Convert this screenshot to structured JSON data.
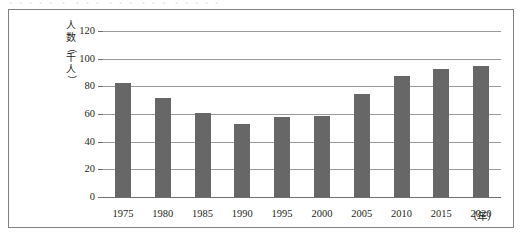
{
  "page": {
    "top_cut_text": "・・・・・ ・ ・・・ ・・・ ・・・ ・・・・・"
  },
  "chart_data": {
    "type": "bar",
    "title": "",
    "subtitle": "",
    "xlabel": "（年）",
    "ylabel": "人数（千人）",
    "ylabel_chars": [
      "人",
      "数",
      "（",
      "千",
      "人",
      "）"
    ],
    "categories": [
      "1975",
      "1980",
      "1985",
      "1990",
      "1995",
      "2000",
      "2005",
      "2010",
      "2015",
      "2020"
    ],
    "values": [
      82.5,
      71.5,
      61,
      53,
      57.5,
      58.5,
      74.5,
      87.5,
      92.5,
      95
    ],
    "ylim": [
      0,
      120
    ],
    "yticks": [
      0,
      20,
      40,
      60,
      80,
      100,
      120
    ],
    "ytick_labels": [
      "0",
      "20",
      "40",
      "60",
      "80",
      "100",
      "120"
    ],
    "grid": true,
    "legend": false,
    "legend_position": "none",
    "bar_color": "#676767",
    "gridline_color": "#9a9a9f",
    "axis_color": "#6e6e73",
    "frame_color": "#808085",
    "background_color": "#ffffff",
    "text_color": "#231f20"
  }
}
